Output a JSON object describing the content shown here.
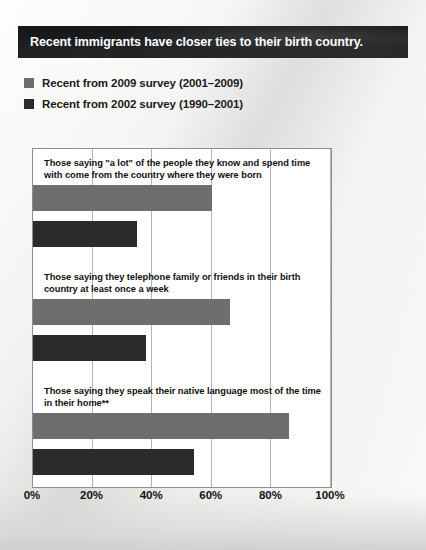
{
  "title": {
    "text": "Recent immigrants have closer ties to their birth country."
  },
  "legend": {
    "items": [
      {
        "label": "Recent from 2009 survey (2001–2009)",
        "color": "#6e6e6e"
      },
      {
        "label": "Recent from 2002 survey (1990–2001)",
        "color": "#2b2b2b"
      }
    ]
  },
  "axis": {
    "ticks": [
      "0%",
      "20%",
      "40%",
      "60%",
      "80%",
      "100%"
    ]
  },
  "chart_data": {
    "type": "bar",
    "orientation": "horizontal",
    "title": "Recent immigrants have closer ties to their birth country.",
    "xlabel": "",
    "ylabel": "",
    "xlim": [
      0,
      100
    ],
    "xticks": [
      0,
      20,
      40,
      60,
      80,
      100
    ],
    "xtick_labels": [
      "0%",
      "20%",
      "40%",
      "60%",
      "80%",
      "100%"
    ],
    "grid": true,
    "legend_position": "above-plot",
    "categories": [
      "Those saying \"a lot\" of the people they know and spend time with come from the country where they were born",
      "Those saying they telephone family or friends in their birth country at least once a week",
      "Those saying they speak their native language most of the time in their home**"
    ],
    "series": [
      {
        "name": "Recent from 2009 survey (2001–2009)",
        "color": "#6e6e6e",
        "values": [
          60,
          66,
          86
        ]
      },
      {
        "name": "Recent from 2002 survey (1990–2001)",
        "color": "#2b2b2b",
        "values": [
          35,
          38,
          54
        ]
      }
    ]
  }
}
